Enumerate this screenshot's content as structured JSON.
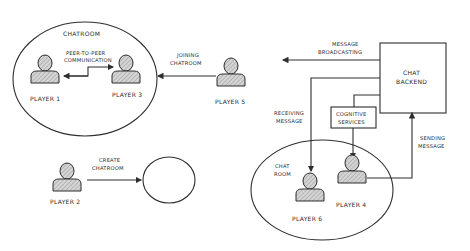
{
  "diagram": {
    "chatroom_top": {
      "label": "Chatroom",
      "players": [
        "Player 1",
        "Player 3"
      ],
      "link_label_line1": "Peer-to-Peer",
      "link_label_line2": "Communication"
    },
    "player5": {
      "label": "Player 5",
      "arrow_label_line1": "Joining",
      "arrow_label_line2": "Chatroom"
    },
    "player2": {
      "label": "Player 2",
      "arrow_label_line1": "Create",
      "arrow_label_line2": "Chatroom"
    },
    "backend": {
      "label_line1": "Chat",
      "label_line2": "Backend"
    },
    "broadcast": {
      "label_line1": "Message",
      "label_line2": "Broadcasting"
    },
    "cognitive": {
      "label_line1": "Cognitive",
      "label_line2": "Services"
    },
    "receiving": {
      "label_line1": "Receiving",
      "label_line2": "Message"
    },
    "sending": {
      "label_line1": "Sending",
      "label_line2": "Message"
    },
    "chatroom_bottom": {
      "label_line1": "Chat",
      "label_line2": "room",
      "players": [
        "Player 6",
        "Player 4"
      ]
    }
  },
  "colors": {
    "ink": "#2e2e2e",
    "hatch": "#9a9a9a",
    "background": "#ffffff"
  }
}
